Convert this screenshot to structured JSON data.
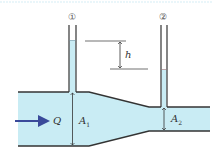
{
  "diagram": {
    "colors": {
      "water": "#c9ecf4",
      "wall": "#333333",
      "flow_arrow": "#3a4a9a",
      "top_rule": "#d6eef6"
    },
    "labels": {
      "tube1": "①",
      "tube2": "②",
      "head_difference": "h",
      "flow": "Q",
      "area1": "A",
      "area1_sub": "1",
      "area2": "A",
      "area2_sub": "2"
    }
  }
}
